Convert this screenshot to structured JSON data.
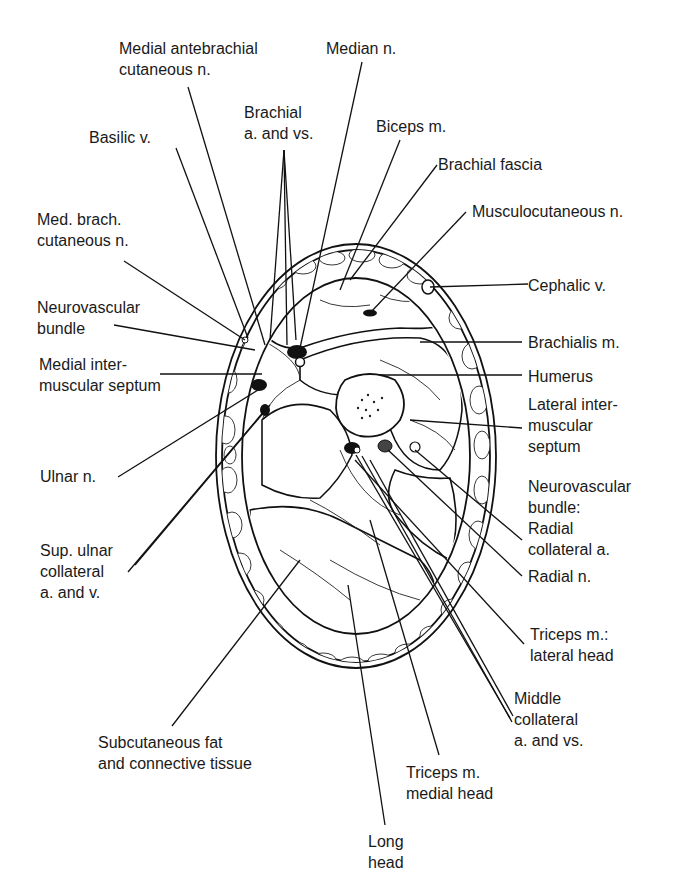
{
  "figure": {
    "labels": {
      "medial_antebrachial_cutaneous": "Medial antebrachial\ncutaneous n.",
      "median_n": "Median n.",
      "brachial_a_vs": "Brachial\na. and vs.",
      "biceps_m": "Biceps m.",
      "basilic_v": "Basilic v.",
      "brachial_fascia": "Brachial fascia",
      "musculocutaneous_n": "Musculocutaneous n.",
      "med_brach_cutaneous": "Med. brach.\ncutaneous n.",
      "cephalic_v": "Cephalic v.",
      "neurovascular_bundle": "Neurovascular\nbundle",
      "brachialis_m": "Brachialis m.",
      "medial_intermuscular_septum": "Medial inter-\nmuscular septum",
      "humerus": "Humerus",
      "lateral_intermuscular_septum": "Lateral inter-\nmuscular\nseptum",
      "ulnar_n": "Ulnar n.",
      "neurovascular_bundle_radial": "Neurovascular\nbundle:\nRadial\ncollateral a.",
      "sup_ulnar_collateral": "Sup. ulnar\ncollateral\na. and v.",
      "radial_n": "Radial n.",
      "triceps_lateral_head": "Triceps m.:\nlateral head",
      "middle_collateral": "Middle\ncollateral\na. and vs.",
      "subcutaneous_fat": "Subcutaneous fat\nand connective tissue",
      "triceps_medial_head": "Triceps m.\nmedial head",
      "long_head": "Long\nhead"
    }
  }
}
